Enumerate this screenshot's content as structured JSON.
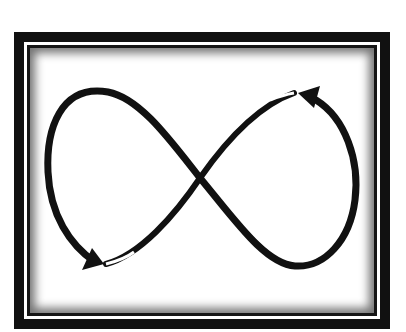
{
  "figure": {
    "colors": {
      "stroke": "#111111",
      "background": "#ffffff",
      "frame": "#111111"
    },
    "arrowheads": [
      {
        "position": "bottom-left",
        "direction": "down-right"
      },
      {
        "position": "top-right",
        "direction": "up-left"
      }
    ]
  }
}
